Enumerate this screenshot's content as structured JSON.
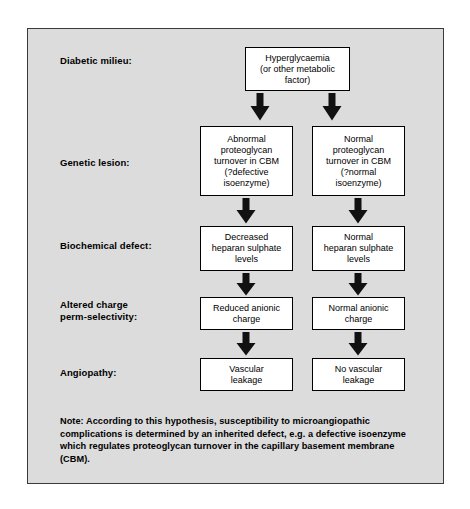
{
  "figure": {
    "background_color": "#dcdcdc",
    "frame_border_color": "#3a3a3a",
    "node_fill_color": "#ffffff",
    "node_border_color": "#000000",
    "arrow_color": "#111111"
  },
  "row_labels": [
    {
      "text": "Diabetic milieu:"
    },
    {
      "text": "Genetic lesion:"
    },
    {
      "text": "Biochemical defect:"
    },
    {
      "text": "Altered charge\nperm-selectivity:"
    },
    {
      "text": "Angiopathy:"
    }
  ],
  "nodes": {
    "top": "Hyperglycaemia\n(or other metabolic\nfactor)",
    "genetic_left": "Abnormal\nproteoglycan\nturnover in CBM\n(?defective\nisoenzyme)",
    "genetic_right": "Normal\nproteoglycan\nturnover in CBM\n(?normal\nisoenzyme)",
    "biochem_left": "Decreased\nheparan sulphate\nlevels",
    "biochem_right": "Normal\nheparan sulphate\nlevels",
    "charge_left": "Reduced anionic\ncharge",
    "charge_right": "Normal anionic\ncharge",
    "angio_left": "Vascular\nleakage",
    "angio_right": "No vascular\nleakage"
  },
  "note": "Note: According to this hypothesis, susceptibility to microangiopathic complications is determined by an inherited defect, e.g. a defective isoenzyme which regulates proteoglycan turnover in the capillary basement membrane (CBM)."
}
